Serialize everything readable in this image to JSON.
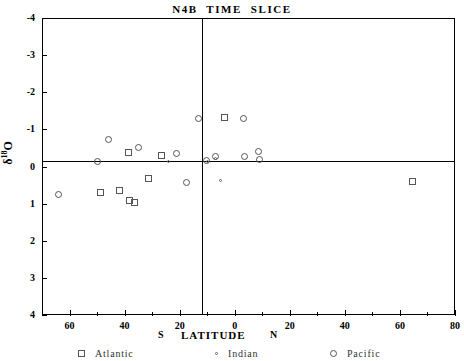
{
  "title": "N4B  TIME  SLICE",
  "axes": {
    "ylabel_delta": "δ",
    "ylabel_sup": "18",
    "ylabel_o": "O",
    "xlabel_south": "S",
    "xlabel_main": "LATITUDE",
    "xlabel_north": "N",
    "y_ticks": [
      "-4",
      "-3",
      "-2",
      "-1",
      "0",
      "1",
      "2",
      "3",
      "4"
    ],
    "x_ticks": [
      "60",
      "40",
      "20",
      "0",
      "20",
      "40",
      "60",
      "80"
    ],
    "x_tick_values": [
      -60,
      -40,
      -20,
      0,
      20,
      40,
      60,
      80
    ],
    "y_range_top": -4,
    "y_range_bottom": 4,
    "x_range_left": -70,
    "x_range_right": 80
  },
  "legend": [
    {
      "key": "atlantic",
      "label": "Atlantic",
      "marker": "square"
    },
    {
      "key": "indian",
      "label": "Indian",
      "marker": "dot"
    },
    {
      "key": "pacific",
      "label": "Pacific",
      "marker": "circle"
    }
  ],
  "colors": {
    "axis": "#000000",
    "marker": "#555555",
    "background": "#ffffff"
  },
  "chart_data": {
    "type": "scatter",
    "title": "N4B  TIME  SLICE",
    "xlabel": "LATITUDE",
    "ylabel": "δ18O",
    "xlim": [
      -70,
      80
    ],
    "ylim": [
      4,
      -4
    ],
    "y_inverted": true,
    "grid": false,
    "legend_position": "bottom",
    "series": [
      {
        "name": "Atlantic",
        "marker": "square",
        "points": [
          {
            "x": -42.5,
            "y": 0.85
          },
          {
            "x": -35.5,
            "y": 0.72
          },
          {
            "x": -31.5,
            "y": 1.05
          },
          {
            "x": -29.5,
            "y": 1.12
          },
          {
            "x": -32.0,
            "y": -0.35
          },
          {
            "x": -24.5,
            "y": -0.5
          },
          {
            "x": -19.5,
            "y": 0.23
          },
          {
            "x": 6.5,
            "y": -1.3
          },
          {
            "x": 63.0,
            "y": 0.55
          }
        ]
      },
      {
        "name": "Indian",
        "marker": "dot",
        "points": [
          {
            "x": -15.5,
            "y": -0.05
          },
          {
            "x": 2.0,
            "y": 0.0
          },
          {
            "x": 5.0,
            "y": 0.08
          },
          {
            "x": 6.5,
            "y": 0.68
          }
        ]
      },
      {
        "name": "Pacific",
        "marker": "circle",
        "points": [
          {
            "x": -59.5,
            "y": 0.9
          },
          {
            "x": -60.0,
            "y": 0.02
          },
          {
            "x": -39.0,
            "y": -0.62
          },
          {
            "x": -42.0,
            "y": 0.0
          },
          {
            "x": -11.0,
            "y": -0.22
          },
          {
            "x": -1.0,
            "y": -1.2
          },
          {
            "x": 0.5,
            "y": -0.05
          },
          {
            "x": 2.0,
            "y": 0.12
          },
          {
            "x": 10.5,
            "y": -0.22
          },
          {
            "x": 12.0,
            "y": 0.0
          },
          {
            "x": 12.5,
            "y": 0.18
          },
          {
            "x": -4.0,
            "y": 0.5
          }
        ]
      }
    ]
  },
  "markers_px": {
    "note": "rendered pixel positions (center) used by template",
    "atlantic": [
      {
        "x": 100,
        "y": 192
      },
      {
        "x": 119,
        "y": 190
      },
      {
        "x": 129,
        "y": 200
      },
      {
        "x": 134,
        "y": 202
      },
      {
        "x": 128,
        "y": 152
      },
      {
        "x": 148,
        "y": 178
      },
      {
        "x": 161,
        "y": 155
      },
      {
        "x": 224,
        "y": 117
      },
      {
        "x": 412,
        "y": 181
      }
    ],
    "indian": [
      {
        "x": 168,
        "y": 161
      },
      {
        "x": 207,
        "y": 161
      },
      {
        "x": 215,
        "y": 158
      },
      {
        "x": 220,
        "y": 180
      }
    ],
    "pacific": [
      {
        "x": 58,
        "y": 194
      },
      {
        "x": 97,
        "y": 161
      },
      {
        "x": 108,
        "y": 139
      },
      {
        "x": 138,
        "y": 147
      },
      {
        "x": 176,
        "y": 153
      },
      {
        "x": 198,
        "y": 118
      },
      {
        "x": 206,
        "y": 160
      },
      {
        "x": 215,
        "y": 156
      },
      {
        "x": 243,
        "y": 118
      },
      {
        "x": 244,
        "y": 156
      },
      {
        "x": 258,
        "y": 151
      },
      {
        "x": 259,
        "y": 159
      },
      {
        "x": 186,
        "y": 182
      }
    ]
  }
}
